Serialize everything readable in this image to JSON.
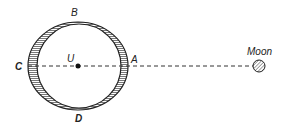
{
  "diagram": {
    "labels": {
      "top": "B",
      "left": "C",
      "center": "U",
      "right": "A",
      "bottom": "D",
      "moon": "Moon"
    },
    "colors": {
      "ink": "#222222",
      "hatch": "#555555",
      "background": "#ffffff"
    }
  }
}
